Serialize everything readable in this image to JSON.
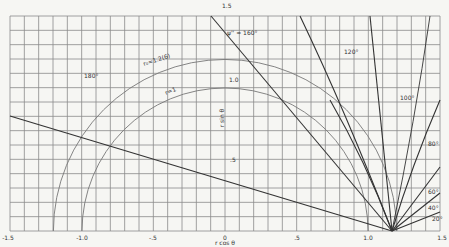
{
  "chart_data": {
    "type": "line",
    "title": "",
    "xlabel": "r cos θ",
    "ylabel": "r sin θ",
    "xlim": [
      -1.5,
      1.5
    ],
    "ylim": [
      0,
      1.5
    ],
    "grid": true,
    "grid_step": 0.1,
    "x_ticks": [
      {
        "value": -1.5,
        "label": "-1.5"
      },
      {
        "value": -1.0,
        "label": "-1.0"
      },
      {
        "value": -0.5,
        "label": "-.5"
      },
      {
        "value": 0,
        "label": "0"
      },
      {
        "value": 0.5,
        "label": ".5"
      },
      {
        "value": 1.0,
        "label": "1.0"
      },
      {
        "value": 1.5,
        "label": "1.5"
      }
    ],
    "y_ticks": [
      {
        "value": 0.5,
        "label": ".5"
      },
      {
        "value": 1.0,
        "label": "1.0"
      },
      {
        "value": 1.5,
        "label": "1.5"
      }
    ],
    "focus_point": {
      "x": 1.17,
      "y": 0
    },
    "series": [
      {
        "name": "r = 1",
        "kind": "circle",
        "center": [
          0,
          0
        ],
        "radius": 1.0,
        "label": "r=1"
      },
      {
        "name": "r0 = 1.2(6)",
        "kind": "circle",
        "center": [
          0,
          0
        ],
        "radius": 1.2,
        "label": "r₀ = 1.2(6)"
      },
      {
        "name": "ψ' = 180°",
        "kind": "line",
        "points": [
          [
            -1.5,
            0.8
          ],
          [
            1.17,
            0
          ]
        ],
        "label": "180°"
      },
      {
        "name": "ψ'' = 160°",
        "kind": "line",
        "points": [
          [
            -0.05,
            1.5
          ],
          [
            1.17,
            0
          ]
        ],
        "label": "ψ'' = 160°"
      },
      {
        "name": "120°",
        "kind": "line",
        "points": [
          [
            0.55,
            1.5
          ],
          [
            1.17,
            0
          ]
        ],
        "label": "120°"
      },
      {
        "name": "100°",
        "kind": "line",
        "points": [
          [
            1.02,
            1.5
          ],
          [
            1.17,
            0
          ]
        ],
        "label": "100°"
      },
      {
        "name": "80°",
        "kind": "line",
        "points": [
          [
            1.5,
            0.92
          ],
          [
            1.17,
            0
          ]
        ],
        "label": "80°"
      },
      {
        "name": "60°",
        "kind": "line",
        "points": [
          [
            1.5,
            0.45
          ],
          [
            1.17,
            0
          ]
        ],
        "label": "60°"
      },
      {
        "name": "40°",
        "kind": "line",
        "points": [
          [
            1.5,
            0.27
          ],
          [
            1.17,
            0
          ]
        ],
        "label": "40°"
      },
      {
        "name": "20°",
        "kind": "line",
        "points": [
          [
            1.5,
            0.13
          ],
          [
            1.17,
            0
          ]
        ],
        "label": "20°"
      }
    ]
  },
  "labels": {
    "x_axis": "r cos θ",
    "y_axis": "r sin θ",
    "r1": "r=1",
    "r0": "r₀=1.2(6)",
    "a180": "180°",
    "a160": "ψ'' = 160°",
    "a120": "120°",
    "a100": "100°",
    "a80": "80°",
    "a60": "60°",
    "a40": "40°",
    "a20": "20°",
    "xt_m15": "-1.5",
    "xt_m10": "-1.0",
    "xt_m05": "-.5",
    "xt_0": "0",
    "xt_05": ".5",
    "xt_10": "1.0",
    "xt_15": "1.5",
    "yt_05": ".5",
    "yt_10": "1.0",
    "yt_15": "1.5"
  }
}
